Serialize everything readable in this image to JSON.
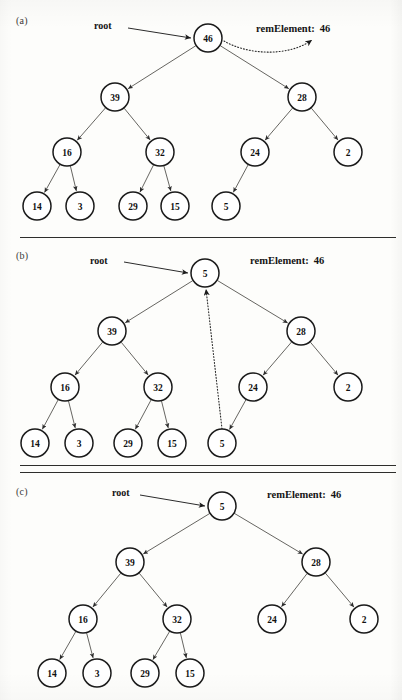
{
  "figure": {
    "type": "binary-tree-removal-diagram",
    "node_radius": 14,
    "panels": [
      {
        "id": "a",
        "label": "(a)",
        "root_label": "root",
        "rem_label": "remElement:",
        "rem_value": "46",
        "root_arrow": {
          "x1": 128,
          "y1": 28,
          "x2": 191,
          "y2": 38
        },
        "dotted_curve": {
          "d": "M 224 41 C 250 56, 290 56, 312 40",
          "arrow_at": [
            314,
            36
          ]
        },
        "nodes": [
          {
            "id": "n46",
            "value": "46",
            "x": 208,
            "y": 38
          },
          {
            "id": "n39",
            "value": "39",
            "x": 115,
            "y": 97
          },
          {
            "id": "n28",
            "value": "28",
            "x": 302,
            "y": 97
          },
          {
            "id": "n16",
            "value": "16",
            "x": 67,
            "y": 152
          },
          {
            "id": "n32",
            "value": "32",
            "x": 160,
            "y": 152
          },
          {
            "id": "n24",
            "value": "24",
            "x": 255,
            "y": 152
          },
          {
            "id": "n2",
            "value": "2",
            "x": 348,
            "y": 152
          },
          {
            "id": "n14",
            "value": "14",
            "x": 37,
            "y": 206
          },
          {
            "id": "n3",
            "value": "3",
            "x": 80,
            "y": 206
          },
          {
            "id": "n29",
            "value": "29",
            "x": 133,
            "y": 206
          },
          {
            "id": "n15",
            "value": "15",
            "x": 175,
            "y": 206
          },
          {
            "id": "n5",
            "value": "5",
            "x": 226,
            "y": 206
          }
        ],
        "edges": [
          {
            "from": "n46",
            "to": "n39"
          },
          {
            "from": "n46",
            "to": "n28"
          },
          {
            "from": "n39",
            "to": "n16"
          },
          {
            "from": "n39",
            "to": "n32"
          },
          {
            "from": "n28",
            "to": "n24"
          },
          {
            "from": "n28",
            "to": "n2"
          },
          {
            "from": "n16",
            "to": "n14"
          },
          {
            "from": "n16",
            "to": "n3"
          },
          {
            "from": "n32",
            "to": "n29"
          },
          {
            "from": "n32",
            "to": "n15"
          },
          {
            "from": "n24",
            "to": "n5"
          }
        ],
        "label_pos": {
          "x": 16,
          "y": 15
        },
        "root_label_pos": {
          "x": 94,
          "y": 20
        },
        "rem_label_pos": {
          "x": 256,
          "y": 23
        }
      },
      {
        "id": "b",
        "label": "(b)",
        "root_label": "root",
        "rem_label": "remElement:",
        "rem_value": "46",
        "root_arrow": {
          "x1": 124,
          "y1": 262,
          "x2": 188,
          "y2": 273
        },
        "dotted_link": {
          "x1": 222,
          "y1": 429,
          "x2": 206,
          "y2": 289
        },
        "nodes": [
          {
            "id": "b5root",
            "value": "5",
            "x": 205,
            "y": 273
          },
          {
            "id": "b39",
            "value": "39",
            "x": 112,
            "y": 331
          },
          {
            "id": "b28",
            "value": "28",
            "x": 301,
            "y": 331
          },
          {
            "id": "b16",
            "value": "16",
            "x": 65,
            "y": 387
          },
          {
            "id": "b32",
            "value": "32",
            "x": 158,
            "y": 387
          },
          {
            "id": "b24",
            "value": "24",
            "x": 253,
            "y": 387
          },
          {
            "id": "b2",
            "value": "2",
            "x": 348,
            "y": 387
          },
          {
            "id": "b14",
            "value": "14",
            "x": 35,
            "y": 443
          },
          {
            "id": "b3",
            "value": "3",
            "x": 79,
            "y": 443
          },
          {
            "id": "b29",
            "value": "29",
            "x": 128,
            "y": 443
          },
          {
            "id": "b15",
            "value": "15",
            "x": 172,
            "y": 443
          },
          {
            "id": "b5leaf",
            "value": "5",
            "x": 222,
            "y": 443
          }
        ],
        "edges": [
          {
            "from": "b5root",
            "to": "b39"
          },
          {
            "from": "b5root",
            "to": "b28"
          },
          {
            "from": "b39",
            "to": "b16"
          },
          {
            "from": "b39",
            "to": "b32"
          },
          {
            "from": "b28",
            "to": "b24"
          },
          {
            "from": "b28",
            "to": "b2"
          },
          {
            "from": "b16",
            "to": "b14"
          },
          {
            "from": "b16",
            "to": "b3"
          },
          {
            "from": "b32",
            "to": "b29"
          },
          {
            "from": "b32",
            "to": "b15"
          },
          {
            "from": "b24",
            "to": "b5leaf"
          }
        ],
        "label_pos": {
          "x": 16,
          "y": 250
        },
        "root_label_pos": {
          "x": 90,
          "y": 255
        },
        "rem_label_pos": {
          "x": 250,
          "y": 255
        }
      },
      {
        "id": "c",
        "label": "(c)",
        "root_label": "root",
        "rem_label": "remElement:",
        "rem_value": "46",
        "root_arrow": {
          "x1": 140,
          "y1": 495,
          "x2": 205,
          "y2": 506
        },
        "nodes": [
          {
            "id": "c5",
            "value": "5",
            "x": 222,
            "y": 506
          },
          {
            "id": "c39",
            "value": "39",
            "x": 130,
            "y": 562
          },
          {
            "id": "c28",
            "value": "28",
            "x": 316,
            "y": 562
          },
          {
            "id": "c16",
            "value": "16",
            "x": 83,
            "y": 619
          },
          {
            "id": "c32",
            "value": "32",
            "x": 177,
            "y": 619
          },
          {
            "id": "c24",
            "value": "24",
            "x": 272,
            "y": 619
          },
          {
            "id": "c2",
            "value": "2",
            "x": 364,
            "y": 619
          },
          {
            "id": "c14",
            "value": "14",
            "x": 52,
            "y": 673
          },
          {
            "id": "c3",
            "value": "3",
            "x": 97,
            "y": 673
          },
          {
            "id": "c29",
            "value": "29",
            "x": 145,
            "y": 673
          },
          {
            "id": "c15",
            "value": "15",
            "x": 190,
            "y": 673
          }
        ],
        "edges": [
          {
            "from": "c5",
            "to": "c39"
          },
          {
            "from": "c5",
            "to": "c28"
          },
          {
            "from": "c39",
            "to": "c16"
          },
          {
            "from": "c39",
            "to": "c32"
          },
          {
            "from": "c28",
            "to": "c24"
          },
          {
            "from": "c28",
            "to": "c2"
          },
          {
            "from": "c16",
            "to": "c14"
          },
          {
            "from": "c16",
            "to": "c3"
          },
          {
            "from": "c32",
            "to": "c29"
          },
          {
            "from": "c32",
            "to": "c15"
          }
        ],
        "label_pos": {
          "x": 16,
          "y": 486
        },
        "root_label_pos": {
          "x": 112,
          "y": 487
        },
        "rem_label_pos": {
          "x": 267,
          "y": 489
        }
      }
    ],
    "dividers": [
      {
        "x": 20,
        "y": 237,
        "width": 376
      },
      {
        "x": 20,
        "y": 465,
        "width": 376
      },
      {
        "x": 20,
        "y": 472,
        "width": 376
      }
    ],
    "colors": {
      "page_background": "#fdfdfb",
      "node_stroke": "#1a1a1a",
      "node_fill": "#ffffff",
      "edge": "#55534f",
      "text": "#111111",
      "divider": "#2e2e2c"
    }
  }
}
